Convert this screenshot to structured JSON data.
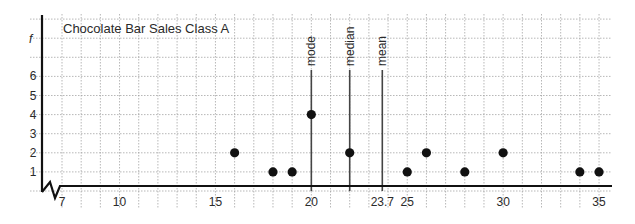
{
  "chart_data": {
    "type": "scatter",
    "subtype": "line-plot (dot plot)",
    "title": "Chocolate Bar Sales Class A",
    "xlabel": "",
    "ylabel": "f",
    "x_ticks": [
      7,
      10,
      15,
      20,
      23.7,
      25,
      30,
      35
    ],
    "x_tick_labels": [
      "7",
      "10",
      "15",
      "20",
      "23.7",
      "25",
      "30",
      "35"
    ],
    "y_ticks": [
      1,
      2,
      3,
      4,
      5,
      6
    ],
    "y_tick_labels": [
      "1",
      "2",
      "3",
      "4",
      "5",
      "6"
    ],
    "xlim": [
      6,
      35.5
    ],
    "ylim": [
      0,
      8
    ],
    "axis_break": true,
    "grid": true,
    "points": [
      {
        "x": 16,
        "y": 2
      },
      {
        "x": 18,
        "y": 1
      },
      {
        "x": 19,
        "y": 1
      },
      {
        "x": 20,
        "y": 4
      },
      {
        "x": 22,
        "y": 2
      },
      {
        "x": 25,
        "y": 1
      },
      {
        "x": 26,
        "y": 2
      },
      {
        "x": 28,
        "y": 1
      },
      {
        "x": 30,
        "y": 2
      },
      {
        "x": 34,
        "y": 1
      },
      {
        "x": 35,
        "y": 1
      }
    ],
    "annotations": [
      {
        "label": "mode",
        "x": 20
      },
      {
        "label": "median",
        "x": 22
      },
      {
        "label": "mean",
        "x": 23.7
      }
    ]
  },
  "colors": {
    "ink": "#111111",
    "grid": "#9a9a9a",
    "line": "#444444"
  }
}
